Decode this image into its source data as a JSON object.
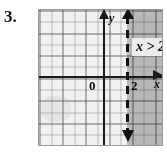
{
  "problem": {
    "number": "3."
  },
  "graph": {
    "axis_labels": {
      "x": "x",
      "y": "y"
    },
    "tick_labels": {
      "origin": "0",
      "boundary": "2"
    },
    "inequality_label": "x > 2",
    "colors": {
      "ink": "#111111",
      "grid_minor": "#787878",
      "grid_major": "#464646",
      "shading": "#a8a8a8",
      "paper": "#f2f1ef"
    }
  },
  "chart_data": {
    "type": "line",
    "title": "",
    "subtitle": "",
    "xlabel": "x",
    "ylabel": "y",
    "xlim": [
      -5.5,
      5.5
    ],
    "ylim": [
      -6,
      6
    ],
    "grid": true,
    "legend": "none",
    "annotations": [
      {
        "text": "x > 2",
        "x": 3.2,
        "y": 3.3
      },
      {
        "text": "0",
        "x": -0.45,
        "y": -0.6
      },
      {
        "text": "2",
        "x": 2.25,
        "y": -0.6
      }
    ],
    "series": [
      {
        "name": "boundary x = 2",
        "type": "vertical-line",
        "x": 2,
        "style": "dashed",
        "arrows": [
          "up",
          "down"
        ],
        "inclusive": false
      }
    ],
    "shaded_regions": [
      {
        "name": "solution set",
        "inequality": "x > 2",
        "x_from": 2,
        "x_to": 5.5,
        "fill": "#a8a8a8"
      }
    ]
  }
}
